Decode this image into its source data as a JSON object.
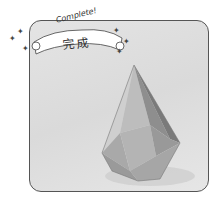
{
  "banner": {
    "subtitle": "Complete!",
    "title": "完成"
  },
  "image": {
    "subject": "origami-faceted-drop-model",
    "description": "Completed origami model photo"
  },
  "icons": {
    "sparkle": "✦"
  }
}
